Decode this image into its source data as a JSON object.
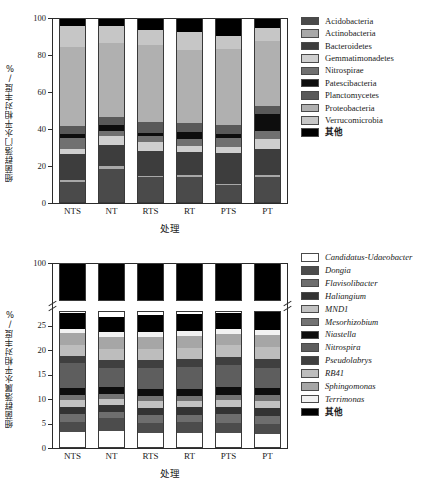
{
  "charts": [
    {
      "id": "phylum",
      "ylabel": "细菌群落门水平相对丰度/%",
      "xlabel": "处理",
      "yticks": [
        "0",
        "20",
        "40",
        "60",
        "80",
        "100"
      ],
      "xticks": [
        "NTS",
        "NT",
        "RTS",
        "RT",
        "PTS",
        "PT"
      ],
      "legend": [
        {
          "label": "Acidobacteria",
          "color": "#4a4a4a",
          "italic": false
        },
        {
          "label": "Actinobacteria",
          "color": "#a8a8a8",
          "italic": false
        },
        {
          "label": "Bacteroidetes",
          "color": "#3d3d3d",
          "italic": false
        },
        {
          "label": "Gemmatimonadetes",
          "color": "#cfcfcf",
          "italic": false
        },
        {
          "label": "Nitrospirae",
          "color": "#707070",
          "italic": false
        },
        {
          "label": "Patescibacteria",
          "color": "#0d0d0d",
          "italic": false
        },
        {
          "label": "Planctomycetes",
          "color": "#595959",
          "italic": false
        },
        {
          "label": "Proteobacteria",
          "color": "#b0b0b0",
          "italic": false
        },
        {
          "label": "Verrucomicrobia",
          "color": "#c6c6c6",
          "italic": false
        },
        {
          "label": "其他",
          "color": "#000000",
          "italic": false,
          "cn": true
        }
      ]
    },
    {
      "id": "genus",
      "ylabel": "细菌群落属水平相对丰度/%",
      "xlabel": "处理",
      "yticks": [
        "0",
        "5",
        "10",
        "15",
        "20",
        "25",
        "100"
      ],
      "xticks": [
        "NTS",
        "NT",
        "RTS",
        "RT",
        "PTS",
        "PT"
      ],
      "legend": [
        {
          "label": "Candidatus-Udaeobacter",
          "color": "#ffffff",
          "italic": true
        },
        {
          "label": "Dongia",
          "color": "#4c4c4c",
          "italic": true
        },
        {
          "label": "Flavisolibacter",
          "color": "#6e6e6e",
          "italic": true
        },
        {
          "label": "Haliangium",
          "color": "#333333",
          "italic": true
        },
        {
          "label": "MND1",
          "color": "#c2c2c2",
          "italic": true
        },
        {
          "label": "Mesorhizobium",
          "color": "#737373",
          "italic": true
        },
        {
          "label": "Niastella",
          "color": "#0d0d0d",
          "italic": true
        },
        {
          "label": "Nitrospira",
          "color": "#5e5e5e",
          "italic": true
        },
        {
          "label": "Pseudolabrys",
          "color": "#3f3f3f",
          "italic": true
        },
        {
          "label": "RB41",
          "color": "#bdbdbd",
          "italic": true
        },
        {
          "label": "Sphingomonas",
          "color": "#a6a6a6",
          "italic": true
        },
        {
          "label": "Terrimonas",
          "color": "#f2f2f2",
          "italic": true
        },
        {
          "label": "其他",
          "color": "#000000",
          "italic": false,
          "cn": true
        }
      ]
    }
  ],
  "chart_data": [
    {
      "type": "bar",
      "stacked": true,
      "id": "phylum-relative-abundance",
      "title": "",
      "xlabel": "处理",
      "ylabel": "细菌群落门水平相对丰度/%",
      "ylim": [
        0,
        100
      ],
      "yticks": [
        0,
        20,
        40,
        60,
        80,
        100
      ],
      "grid": false,
      "legend_position": "right",
      "categories": [
        "NTS",
        "NT",
        "RTS",
        "RT",
        "PTS",
        "PT"
      ],
      "series": [
        {
          "name": "Acidobacteria",
          "color": "#4a4a4a",
          "values": [
            11.0,
            18.0,
            13.3,
            13.3,
            9.0,
            13.5
          ]
        },
        {
          "name": "Actinobacteria",
          "color": "#a8a8a8",
          "values": [
            1.0,
            1.2,
            1.0,
            1.5,
            1.0,
            1.0
          ]
        },
        {
          "name": "Bacteroidetes",
          "color": "#3d3d3d",
          "values": [
            14.0,
            11.8,
            13.5,
            12.5,
            16.5,
            14.0
          ]
        },
        {
          "name": "Gemmatimonadetes",
          "color": "#cfcfcf",
          "values": [
            2.5,
            4.5,
            4.5,
            3.0,
            3.0,
            5.5
          ]
        },
        {
          "name": "Nitrospirae",
          "color": "#707070",
          "values": [
            6.0,
            3.0,
            3.5,
            4.0,
            5.0,
            4.5
          ]
        },
        {
          "name": "Patescibacteria",
          "color": "#0d0d0d",
          "values": [
            2.5,
            3.0,
            1.5,
            3.5,
            2.5,
            9.0
          ]
        },
        {
          "name": "Planctomycetes",
          "color": "#595959",
          "values": [
            4.0,
            4.5,
            6.0,
            5.0,
            4.5,
            4.5
          ]
        },
        {
          "name": "Proteobacteria",
          "color": "#b0b0b0",
          "values": [
            43.0,
            40.0,
            41.5,
            39.5,
            41.5,
            35.0
          ]
        },
        {
          "name": "Verrucomicrobia",
          "color": "#c6c6c6",
          "values": [
            11.0,
            9.0,
            8.0,
            9.5,
            7.0,
            7.0
          ]
        },
        {
          "name": "其他",
          "color": "#000000",
          "values": [
            5.0,
            5.0,
            7.2,
            8.2,
            10.0,
            6.0
          ]
        }
      ]
    },
    {
      "type": "bar",
      "stacked": true,
      "id": "genus-relative-abundance",
      "title": "",
      "xlabel": "处理",
      "ylabel": "细菌群落属水平相对丰度/%",
      "ylim": [
        0,
        100
      ],
      "axis_break": {
        "lower_max": 28,
        "upper_min": 95,
        "upper_max": 100
      },
      "yticks": [
        0,
        5,
        10,
        15,
        20,
        25,
        100
      ],
      "grid": false,
      "legend_position": "right",
      "categories": [
        "NTS",
        "NT",
        "RTS",
        "RT",
        "PTS",
        "PT"
      ],
      "series": [
        {
          "name": "Candidatus-Udaeobacter",
          "color": "#ffffff",
          "values": [
            3.0,
            3.3,
            2.8,
            2.8,
            2.8,
            2.6
          ]
        },
        {
          "name": "Dongia",
          "color": "#4c4c4c",
          "values": [
            2.2,
            2.6,
            2.2,
            2.3,
            2.2,
            2.2
          ]
        },
        {
          "name": "Flavisolibacter",
          "color": "#6e6e6e",
          "values": [
            1.6,
            1.3,
            1.5,
            1.5,
            1.7,
            1.6
          ]
        },
        {
          "name": "Haliangium",
          "color": "#333333",
          "values": [
            1.4,
            1.4,
            1.5,
            1.5,
            1.5,
            1.6
          ]
        },
        {
          "name": "MND1",
          "color": "#c2c2c2",
          "values": [
            1.5,
            1.3,
            1.4,
            1.4,
            1.4,
            1.5
          ]
        },
        {
          "name": "Mesorhizobium",
          "color": "#737373",
          "values": [
            1.0,
            1.0,
            1.1,
            1.0,
            1.1,
            1.1
          ]
        },
        {
          "name": "Niastella",
          "color": "#0d0d0d",
          "values": [
            1.4,
            1.3,
            1.3,
            1.4,
            1.5,
            1.4
          ]
        },
        {
          "name": "Nitrospira",
          "color": "#5e5e5e",
          "values": [
            5.0,
            3.9,
            4.3,
            4.4,
            4.6,
            4.2
          ]
        },
        {
          "name": "Pseudolabrys",
          "color": "#3f3f3f",
          "values": [
            1.5,
            1.7,
            1.7,
            1.8,
            1.7,
            1.8
          ]
        },
        {
          "name": "RB41",
          "color": "#bdbdbd",
          "values": [
            2.3,
            2.2,
            2.2,
            2.2,
            2.3,
            2.5
          ]
        },
        {
          "name": "Sphingomonas",
          "color": "#a6a6a6",
          "values": [
            2.4,
            2.5,
            2.5,
            2.4,
            2.4,
            2.5
          ]
        },
        {
          "name": "Terrimonas",
          "color": "#f2f2f2",
          "values": [
            0.9,
            1.0,
            1.0,
            1.0,
            1.0,
            1.0
          ]
        },
        {
          "name": "其他",
          "color": "#000000",
          "values": [
            3.3,
            3.0,
            3.5,
            3.6,
            3.3,
            4.0
          ]
        }
      ],
      "upper_segment": {
        "name": "其他",
        "color": "#000000",
        "values": [
          100,
          100,
          100,
          100,
          100,
          100
        ]
      }
    }
  ]
}
